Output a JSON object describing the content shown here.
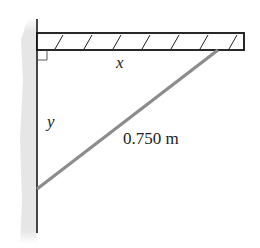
{
  "diagram": {
    "type": "wall-mounted beam with diagonal strut",
    "labels": {
      "horizontal": "x",
      "vertical": "y",
      "strut_length": "0.750 m"
    },
    "colors": {
      "wall_shading": "#e6e6e6",
      "line": "#222222",
      "strut": "#8c8c8c",
      "background": "#ffffff"
    },
    "elements": {
      "wall": "vertical wall line with shaded side",
      "beam": "horizontal hatched beam",
      "strut": "diagonal support strut",
      "right_angle_marker": "right angle at wall-beam joint"
    }
  }
}
